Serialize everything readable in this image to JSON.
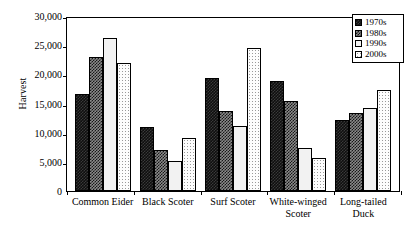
{
  "chart_data": {
    "type": "bar",
    "title": "",
    "xlabel": "",
    "ylabel": "Harvest",
    "ylim": [
      0,
      30000
    ],
    "ytick_labels": [
      "30,000",
      "25,000",
      "20,000",
      "15,000",
      "10,000",
      "5,000",
      "0"
    ],
    "ytick_values": [
      30000,
      25000,
      20000,
      15000,
      10000,
      5000,
      0
    ],
    "grid": false,
    "legend_position": "top-right",
    "categories": [
      "Common Eider",
      "Black Scoter",
      "Surf Scoter",
      "White-winged\nScoter",
      "Long-tailed\nDuck"
    ],
    "series": [
      {
        "name": "1970s",
        "pattern": "dark-checker",
        "values": [
          16700,
          10900,
          19400,
          18800,
          12200
        ]
      },
      {
        "name": "1980s",
        "pattern": "medium-checker",
        "values": [
          22900,
          7100,
          13700,
          15400,
          13300
        ]
      },
      {
        "name": "1990s",
        "pattern": "light-crosshatch",
        "values": [
          26300,
          5200,
          11100,
          7400,
          14200
        ]
      },
      {
        "name": "2000s",
        "pattern": "fine-dots",
        "values": [
          22000,
          9100,
          24600,
          5600,
          17300
        ]
      }
    ]
  },
  "legend": {
    "items": [
      {
        "label": "1970s"
      },
      {
        "label": "1980s"
      },
      {
        "label": "1990s"
      },
      {
        "label": "2000s"
      }
    ]
  },
  "colors": {
    "axis": "#000000",
    "background": "#ffffff",
    "series_1970s": "#0e0e0e",
    "series_1980s": "#8a8a8a",
    "series_1990s": "#f2f2f2",
    "series_2000s": "#fdfdfd"
  }
}
